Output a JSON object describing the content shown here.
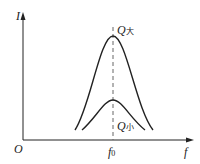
{
  "diagram": {
    "type": "resonance-curves",
    "y_axis_label": "I",
    "x_axis_label": "f",
    "origin_label": "O",
    "x_tick": {
      "label": "f",
      "subscript": "0"
    },
    "curves": [
      {
        "name": "Q",
        "subscript": "大",
        "description": "high Q, sharp peak"
      },
      {
        "name": "Q",
        "subscript": "小",
        "description": "low Q, broad peak"
      }
    ],
    "colors": {
      "line": "#222222",
      "dashed": "#555555"
    }
  }
}
